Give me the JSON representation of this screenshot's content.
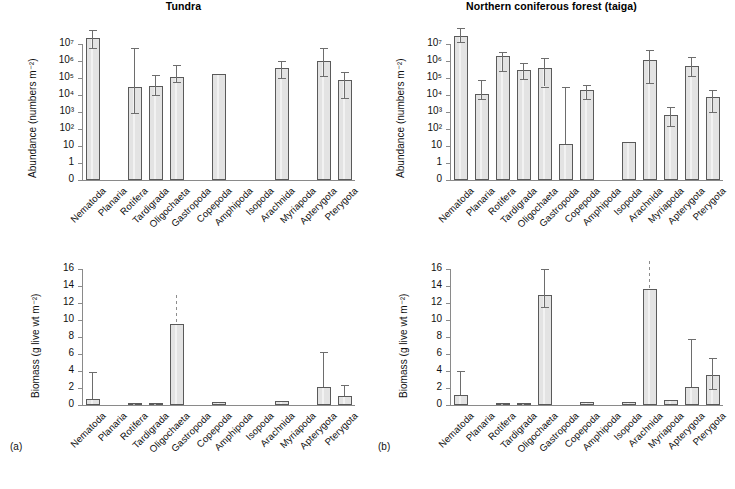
{
  "figure": {
    "panel_letters": {
      "a": "(a)",
      "b": "(b)"
    },
    "titles": {
      "tundra": "Tundra",
      "taiga": "Northern coniferous forest (taiga)"
    },
    "axis_labels": {
      "abundance": "Abundance (numbers m⁻²)",
      "biomass": "Biomass (g live wt m⁻²)"
    },
    "taxa": [
      "Nematoda",
      "Planaria",
      "Rotifera",
      "Tardigrada",
      "Oligochaeta",
      "Gastropoda",
      "Copepoda",
      "Amphipoda",
      "Isopoda",
      "Arachnida",
      "Myriapoda",
      "Apterygota",
      "Pterygota"
    ],
    "abundance_ticks": [
      "0",
      "1",
      "10",
      "10²",
      "10³",
      "10⁴",
      "10⁵",
      "10⁶",
      "10⁷"
    ],
    "biomass_ticks": [
      "0",
      "2",
      "4",
      "6",
      "8",
      "10",
      "12",
      "14",
      "16"
    ],
    "colors": {
      "bar_fill": "#e3e3e3",
      "bar_stroke": "#5a5a5a",
      "axis": "#8a8a8a",
      "error": "#6d6d6d",
      "text": "#111111"
    }
  },
  "chart_data": [
    {
      "type": "bar",
      "id": "tundra-abundance",
      "title": "Tundra",
      "xlabel": "",
      "ylabel": "Abundance (numbers m⁻²)",
      "yscale": "log-with-zero",
      "ytick_labels": [
        "0",
        "1",
        "10",
        "10²",
        "10³",
        "10⁴",
        "10⁵",
        "10⁶",
        "10⁷"
      ],
      "ytick_exponents": [
        null,
        0,
        1,
        2,
        3,
        4,
        5,
        6,
        7
      ],
      "ylim": [
        0,
        7
      ],
      "grid": false,
      "legend": "none",
      "categories": [
        "Nematoda",
        "Planaria",
        "Rotifera",
        "Tardigrada",
        "Oligochaeta",
        "Gastropoda",
        "Copepoda",
        "Amphipoda",
        "Isopoda",
        "Arachnida",
        "Myriapoda",
        "Apterygota",
        "Pterygota"
      ],
      "values_log10": [
        6.35,
        null,
        3.5,
        3.53,
        4.08,
        null,
        4.22,
        null,
        null,
        4.6,
        null,
        5.0,
        3.87
      ],
      "err_low_log10": [
        5.75,
        null,
        1.95,
        3.0,
        3.75,
        null,
        null,
        null,
        null,
        4.0,
        null,
        4.1,
        2.85
      ],
      "err_high_log10": [
        6.82,
        null,
        5.75,
        4.2,
        4.75,
        null,
        null,
        null,
        null,
        5.0,
        null,
        5.75,
        4.35
      ],
      "values_approx": [
        "2.2e6",
        "absent",
        "3.2e3",
        "3.4e3",
        "1.2e4",
        "absent",
        "1.7e4",
        "absent",
        "absent",
        "4.0e4",
        "absent",
        "1.0e5",
        "7.4e3"
      ]
    },
    {
      "type": "bar",
      "id": "taiga-abundance",
      "title": "Northern coniferous forest (taiga)",
      "xlabel": "",
      "ylabel": "Abundance (numbers m⁻²)",
      "yscale": "log-with-zero",
      "ytick_labels": [
        "0",
        "1",
        "10",
        "10²",
        "10³",
        "10⁴",
        "10⁵",
        "10⁶",
        "10⁷"
      ],
      "ytick_exponents": [
        null,
        0,
        1,
        2,
        3,
        4,
        5,
        6,
        7
      ],
      "ylim": [
        0,
        7
      ],
      "grid": false,
      "legend": "none",
      "categories": [
        "Nematoda",
        "Planaria",
        "Rotifera",
        "Tardigrada",
        "Oligochaeta",
        "Gastropoda",
        "Copepoda",
        "Amphipoda",
        "Isopoda",
        "Arachnida",
        "Myriapoda",
        "Apterygota",
        "Pterygota"
      ],
      "values_log10": [
        6.45,
        3.08,
        5.27,
        4.5,
        4.6,
        0.12,
        3.28,
        null,
        0.25,
        5.05,
        1.83,
        4.68,
        2.88
      ],
      "err_low_log10": [
        6.1,
        2.75,
        4.4,
        3.95,
        3.5,
        null,
        2.75,
        null,
        null,
        3.7,
        1.2,
        4.1,
        2.0
      ],
      "err_high_log10": [
        6.95,
        3.9,
        5.55,
        4.9,
        5.2,
        3.45,
        3.6,
        null,
        null,
        5.62,
        2.3,
        5.25,
        3.3
      ],
      "values_approx": [
        "2.8e6",
        "1.2e3",
        "1.9e5",
        "3.1e4",
        "4.0e4",
        "0.3",
        "1.9e3",
        "absent",
        "0.45",
        "1.1e5",
        "68",
        "4.8e4",
        "760"
      ]
    },
    {
      "type": "bar",
      "id": "tundra-biomass",
      "title": "",
      "xlabel": "",
      "ylabel": "Biomass (g live wt m⁻²)",
      "yscale": "linear",
      "ytick_labels": [
        "0",
        "2",
        "4",
        "6",
        "8",
        "10",
        "12",
        "14",
        "16"
      ],
      "ylim": [
        0,
        16
      ],
      "grid": false,
      "legend": "none",
      "categories": [
        "Nematoda",
        "Planaria",
        "Rotifera",
        "Tardigrada",
        "Oligochaeta",
        "Gastropoda",
        "Copepoda",
        "Amphipoda",
        "Isopoda",
        "Arachnida",
        "Myriapoda",
        "Apterygota",
        "Pterygota"
      ],
      "values": [
        0.7,
        null,
        0.25,
        0.25,
        9.5,
        null,
        0.3,
        null,
        null,
        0.5,
        null,
        2.1,
        1.1
      ],
      "err_low": [
        null,
        null,
        null,
        null,
        null,
        null,
        null,
        null,
        null,
        null,
        null,
        null,
        null
      ],
      "err_high": [
        3.9,
        null,
        null,
        null,
        13.0,
        null,
        null,
        null,
        null,
        null,
        null,
        6.2,
        2.3
      ],
      "err_dashed": [
        false,
        false,
        false,
        false,
        true,
        false,
        false,
        false,
        false,
        false,
        false,
        false,
        false
      ]
    },
    {
      "type": "bar",
      "id": "taiga-biomass",
      "title": "",
      "xlabel": "",
      "ylabel": "Biomass (g live wt m⁻²)",
      "yscale": "linear",
      "ytick_labels": [
        "0",
        "2",
        "4",
        "6",
        "8",
        "10",
        "12",
        "14",
        "16"
      ],
      "ylim": [
        0,
        16
      ],
      "grid": false,
      "legend": "none",
      "categories": [
        "Nematoda",
        "Planaria",
        "Rotifera",
        "Tardigrada",
        "Oligochaeta",
        "Gastropoda",
        "Copepoda",
        "Amphipoda",
        "Isopoda",
        "Arachnida",
        "Myriapoda",
        "Apterygota",
        "Pterygota"
      ],
      "values": [
        1.2,
        null,
        0.25,
        0.25,
        13.0,
        null,
        0.3,
        null,
        0.3,
        13.7,
        0.55,
        2.1,
        3.5
      ],
      "err_low": [
        null,
        null,
        null,
        null,
        11.5,
        null,
        null,
        null,
        null,
        null,
        null,
        null,
        1.9
      ],
      "err_high": [
        4.0,
        null,
        null,
        null,
        16.0,
        null,
        null,
        null,
        null,
        17.0,
        null,
        7.8,
        5.5
      ],
      "err_dashed": [
        false,
        false,
        false,
        false,
        false,
        false,
        false,
        false,
        false,
        true,
        false,
        false,
        false
      ]
    }
  ]
}
